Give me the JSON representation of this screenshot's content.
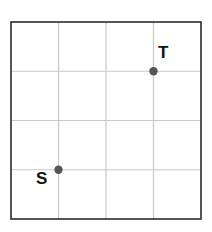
{
  "figure": {
    "type": "grid-graph",
    "width": 212,
    "height": 232,
    "background_color": "#ffffff"
  },
  "grid": {
    "left": 11,
    "top": 22,
    "right": 201,
    "bottom": 219,
    "columns": 4,
    "rows": 4,
    "cell_width": 47.5,
    "cell_height": 49.25,
    "border_color": "#2b2b2b",
    "border_width": 1.6,
    "line_color": "#c9c9c9",
    "line_width": 1.2,
    "vertical_line_x": [
      58.5,
      106,
      153.5
    ],
    "horizontal_line_y": [
      71.25,
      120.5,
      169.75
    ]
  },
  "nodes": [
    {
      "id": "S",
      "label": "S",
      "grid_col": 1,
      "grid_row": 3,
      "x": 58.5,
      "y": 169.75,
      "radius": 4.2,
      "color": "#555555",
      "label_position": "below-left"
    },
    {
      "id": "T",
      "label": "T",
      "grid_col": 3,
      "grid_row": 1,
      "x": 153.5,
      "y": 71.25,
      "radius": 4.2,
      "color": "#555555",
      "label_position": "above-right"
    }
  ],
  "labels": {
    "start": "S",
    "target": "T"
  }
}
